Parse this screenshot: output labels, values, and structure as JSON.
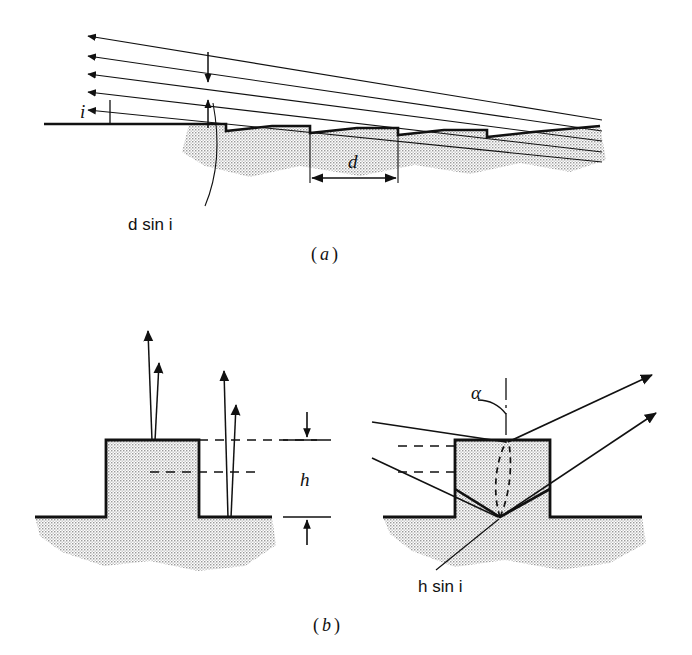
{
  "figure": {
    "title_text": "",
    "background_color": "#ffffff",
    "ink_color": "#111111",
    "hatch_color": "#d8d8d8",
    "panels": [
      {
        "id": "a",
        "caption_open": "(",
        "caption_letter": "a",
        "caption_close": ")",
        "description": "Blazed sawtooth grating with parallel incident rays at angle i",
        "labels": [
          {
            "name": "incidence-angle",
            "text": "i",
            "italic": true
          },
          {
            "name": "path-difference",
            "text": "d sin i",
            "symbol": "d",
            "func": "sin",
            "angle": "i"
          },
          {
            "name": "groove-spacing",
            "text": "d",
            "italic": true
          }
        ],
        "ray_count": 5,
        "groove_count": 4
      },
      {
        "id": "b",
        "caption_open": "(",
        "caption_letter": "b",
        "caption_close": ")",
        "description": "Step-profile grating: normal incidence (left) and oblique incidence at angle alpha (right)",
        "labels": [
          {
            "name": "step-height",
            "text": "h",
            "italic": true
          },
          {
            "name": "blaze-angle",
            "text": "α",
            "italic": true
          },
          {
            "name": "path-difference",
            "text": "h sin i",
            "symbol": "h",
            "func": "sin",
            "angle": "i"
          }
        ],
        "left_sub": {
          "name": "normal-incidence-diagram",
          "ray_pairs": 2
        },
        "right_sub": {
          "name": "oblique-incidence-diagram",
          "ray_pairs": 2
        }
      }
    ]
  }
}
